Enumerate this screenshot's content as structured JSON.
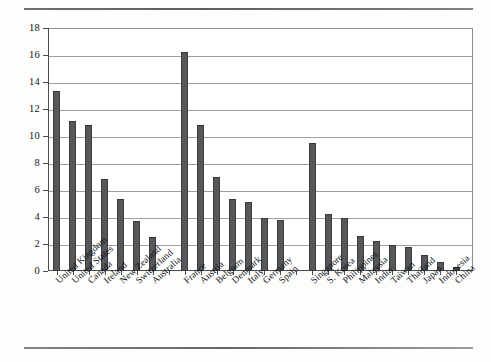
{
  "figure": {
    "background": "#fdfdfc",
    "bar_color": "#56575b",
    "grid_color": "#7e7f83",
    "axis_color": "#4c4d51"
  },
  "chart_data": {
    "type": "bar",
    "title": "",
    "subtitle": "",
    "xlabel": "",
    "ylabel": "",
    "ylim": [
      0,
      18
    ],
    "ytick_step": 2,
    "yticks": [
      0,
      2,
      4,
      6,
      8,
      10,
      12,
      14,
      16,
      18
    ],
    "ytick_labels": [
      "0",
      "2",
      "4",
      "6",
      "8",
      "10",
      "12",
      "14",
      "16",
      "18"
    ],
    "grid": true,
    "grid_axis": "y",
    "legend": false,
    "legend_position": "none",
    "orientation": "vertical",
    "groups": [
      {
        "name": "group-1",
        "categories": [
          "United Kingdom",
          "United States",
          "Canada",
          "Ireland",
          "New Zealand",
          "Switzerland",
          "Australia"
        ],
        "values": [
          13.3,
          11.1,
          10.8,
          6.8,
          5.3,
          3.7,
          2.5
        ]
      },
      {
        "name": "group-2",
        "categories": [
          "France",
          "Austria",
          "Belgium",
          "Denmark",
          "Italy",
          "Germany",
          "Spain"
        ],
        "values": [
          16.2,
          10.8,
          7.0,
          5.3,
          5.1,
          3.9,
          3.8
        ]
      },
      {
        "name": "group-3",
        "categories": [
          "Singapore",
          "S. Korea",
          "Philippines",
          "Malaysia",
          "India",
          "Taiwan",
          "Thailand",
          "Japan",
          "Indonesia",
          "China"
        ],
        "values": [
          9.5,
          4.2,
          3.9,
          2.6,
          2.2,
          1.9,
          1.8,
          1.2,
          0.7,
          0.3
        ]
      }
    ],
    "categories": [
      "United Kingdom",
      "United States",
      "Canada",
      "Ireland",
      "New Zealand",
      "Switzerland",
      "Australia",
      "France",
      "Austria",
      "Belgium",
      "Denmark",
      "Italy",
      "Germany",
      "Spain",
      "Singapore",
      "S. Korea",
      "Philippines",
      "Malaysia",
      "India",
      "Taiwan",
      "Thailand",
      "Japan",
      "Indonesia",
      "China"
    ],
    "values": [
      13.3,
      11.1,
      10.8,
      6.8,
      5.3,
      3.7,
      2.5,
      16.2,
      10.8,
      7.0,
      5.3,
      5.1,
      3.9,
      3.8,
      9.5,
      4.2,
      3.9,
      2.6,
      2.2,
      1.9,
      1.8,
      1.2,
      0.7,
      0.3
    ]
  }
}
